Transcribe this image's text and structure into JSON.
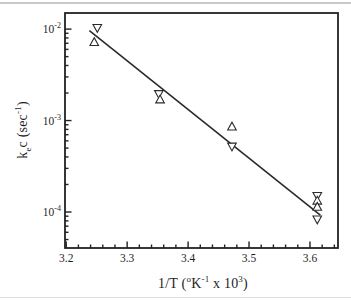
{
  "figure": {
    "background": "#ffffff",
    "top_rule_color": "#c9c9c9",
    "bottom_rule_color": "#dedede",
    "axis_color": "#222222",
    "marker_color": "#2a2a2a",
    "line_color": "#2a2a2a",
    "text_color": "#1f1f1f"
  },
  "chart_data": {
    "type": "scatter",
    "title": "",
    "xlabel": "1/T (oK-1 x 103)",
    "ylabel": "kec (sec-1)",
    "xlabel_parts": [
      {
        "text": "1/T ("
      },
      {
        "text": "o",
        "style": "sup"
      },
      {
        "text": "K"
      },
      {
        "text": "-1",
        "style": "sup"
      },
      {
        "text": " x 10"
      },
      {
        "text": "3",
        "style": "sup"
      },
      {
        "text": ")"
      }
    ],
    "ylabel_parts": [
      {
        "text": "k"
      },
      {
        "text": "e",
        "style": "sub"
      },
      {
        "text": "c (sec"
      },
      {
        "text": "-1",
        "style": "sup"
      },
      {
        "text": ")"
      }
    ],
    "x_axis": {
      "min": 3.198,
      "max": 3.646,
      "major_ticks": [
        3.2,
        3.3,
        3.4,
        3.5,
        3.6
      ],
      "major_tick_labels": [
        "3.2",
        "3.3",
        "3.4",
        "3.5",
        "3.6"
      ],
      "minor_step": 0.02
    },
    "y_axis": {
      "scale": "log",
      "min": 4.04e-05,
      "max": 0.015,
      "decade_exponents": [
        -2,
        -3,
        -4
      ],
      "decade_labels": [
        {
          "base": "10",
          "exp": "-2",
          "value": 0.01
        },
        {
          "base": "10",
          "exp": "-3",
          "value": 0.001
        },
        {
          "base": "10",
          "exp": "-4",
          "value": 0.0001
        }
      ]
    },
    "grid": false,
    "legend": "none",
    "series": [
      {
        "name": "triangle-down-series",
        "marker": "triangle-down",
        "points": [
          [
            3.251,
            0.0103
          ],
          [
            3.352,
            0.00195
          ],
          [
            3.472,
            0.00052
          ],
          [
            3.612,
            0.00015
          ],
          [
            3.612,
            8.3e-05
          ]
        ]
      },
      {
        "name": "triangle-up-series",
        "marker": "triangle-up",
        "points": [
          [
            3.246,
            0.0072
          ],
          [
            3.354,
            0.0017
          ],
          [
            3.472,
            0.00086
          ],
          [
            3.612,
            0.000133
          ],
          [
            3.612,
            0.000114
          ]
        ]
      }
    ],
    "fit_line": {
      "x1": 3.238,
      "y1": 0.0096,
      "x2": 3.617,
      "y2": 9.25e-05
    }
  }
}
